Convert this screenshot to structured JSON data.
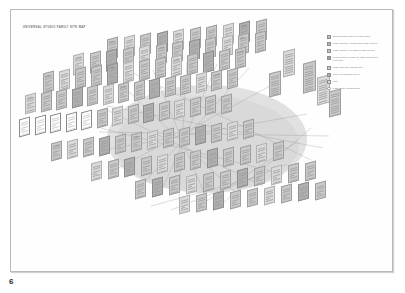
{
  "page": {
    "number": "6",
    "title": "Universal Studio Family Site Map"
  },
  "legend": {
    "items": [
      {
        "marker": "swatch",
        "color": "#bdbdbd",
        "label": "Section/Main Page on USF Portal"
      },
      {
        "marker": "swatch",
        "color": "#b5b5b5",
        "label": "Page category located with USF section"
      },
      {
        "marker": "swatch",
        "color": "#c4c4c4",
        "label": "Page located in a shared USF section"
      },
      {
        "marker": "swatch",
        "color": "#9f9f9f",
        "label": "Recipe/Gallery Page on USF maintained externally"
      },
      {
        "marker": "swatch",
        "color": "#cfcfcf",
        "label": "Page with USF affiliate site"
      },
      {
        "marker": "swatch",
        "color": "#aeaeae",
        "label": "Page on calendar server"
      },
      {
        "marker": "swatch",
        "color": "#dadada",
        "label": "Link"
      },
      {
        "marker": "dot",
        "color": "#ffffff",
        "label": "Page under construction"
      }
    ]
  },
  "diagram": {
    "type": "isometric-sitemap",
    "scope_region_label": "",
    "card_labels": [
      "Home",
      "Films",
      "Parks",
      "Tickets",
      "Events",
      "Shop",
      "News",
      "About",
      "Contact",
      "Support",
      "Hotels",
      "Dining",
      "Groups",
      "Careers",
      "Press"
    ]
  }
}
